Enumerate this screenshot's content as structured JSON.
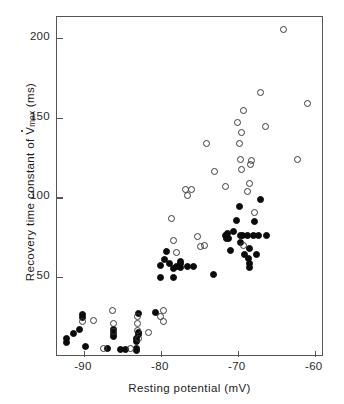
{
  "chart_data": {
    "type": "scatter",
    "title": "",
    "xlabel": "Resting potential (mV)",
    "ylabel_parts": {
      "before": "Recovery time constant of ",
      "symbol": "V",
      "subscript": "max",
      "after": " (ms)"
    },
    "ylabel": "Recovery time constant of V̇max (ms)",
    "xlim": [
      -93.5,
      -58.8
    ],
    "ylim": [
      0,
      213
    ],
    "xticks": [
      -90,
      -80,
      -70,
      -60
    ],
    "xtick_labels": [
      "-90",
      "-80",
      "-70",
      "-60"
    ],
    "yticks": [
      50,
      100,
      150,
      200
    ],
    "ytick_labels": [
      "50",
      "100",
      "150",
      "200"
    ],
    "grid": false,
    "legend": "none",
    "series": [
      {
        "name": "filled-circles",
        "marker": "filled circle",
        "color": "#0b0b0b",
        "points": [
          [
            -92.3,
            11.5
          ],
          [
            -92.3,
            9.0
          ],
          [
            -91.3,
            15.0
          ],
          [
            -90.6,
            17.5
          ],
          [
            -90.2,
            26.5
          ],
          [
            -90.2,
            24.5
          ],
          [
            -89.8,
            6.5
          ],
          [
            -87.0,
            5.5
          ],
          [
            -86.2,
            17.5
          ],
          [
            -86.2,
            15.0
          ],
          [
            -86.2,
            13.0
          ],
          [
            -85.3,
            5.0
          ],
          [
            -84.6,
            4.5
          ],
          [
            -83.2,
            11.5
          ],
          [
            -83.2,
            9.5
          ],
          [
            -83.2,
            5.5
          ],
          [
            -83.2,
            4.0
          ],
          [
            -82.9,
            27.0
          ],
          [
            -82.9,
            15.5
          ],
          [
            -82.9,
            14.0
          ],
          [
            -80.7,
            28.0
          ],
          [
            -80.0,
            50.0
          ],
          [
            -80.0,
            57.5
          ],
          [
            -79.5,
            61.0
          ],
          [
            -79.3,
            66.0
          ],
          [
            -78.9,
            58.5
          ],
          [
            -78.3,
            55.5
          ],
          [
            -78.3,
            49.5
          ],
          [
            -78.0,
            57.0
          ],
          [
            -77.4,
            58.5
          ],
          [
            -77.4,
            60.0
          ],
          [
            -77.4,
            56.0
          ],
          [
            -76.6,
            57.0
          ],
          [
            -75.8,
            56.5
          ],
          [
            -73.2,
            51.5
          ],
          [
            -71.6,
            76.0
          ],
          [
            -71.5,
            74.5
          ],
          [
            -71.4,
            77.5
          ],
          [
            -71.2,
            74.5
          ],
          [
            -71.0,
            66.5
          ],
          [
            -70.6,
            78.5
          ],
          [
            -70.2,
            85.5
          ],
          [
            -69.8,
            94.0
          ],
          [
            -69.7,
            76.0
          ],
          [
            -69.6,
            72.0
          ],
          [
            -69.4,
            76.0
          ],
          [
            -69.1,
            64.5
          ],
          [
            -68.8,
            76.0
          ],
          [
            -68.6,
            61.5
          ],
          [
            -68.5,
            68.0
          ],
          [
            -68.5,
            58.5
          ],
          [
            -68.5,
            56.0
          ],
          [
            -67.9,
            76.0
          ],
          [
            -67.8,
            85.0
          ],
          [
            -67.6,
            64.5
          ],
          [
            -67.3,
            76.0
          ],
          [
            -67.0,
            98.5
          ],
          [
            -66.3,
            76.0
          ]
        ]
      },
      {
        "name": "open-circles",
        "marker": "open circle",
        "color": "#3a3a3a",
        "points": [
          [
            -90.2,
            22.0
          ],
          [
            -88.8,
            23.0
          ],
          [
            -87.4,
            5.5
          ],
          [
            -86.3,
            29.0
          ],
          [
            -86.2,
            21.0
          ],
          [
            -86.2,
            16.0
          ],
          [
            -84.0,
            5.5
          ],
          [
            -83.0,
            25.5
          ],
          [
            -83.0,
            21.0
          ],
          [
            -83.0,
            16.5
          ],
          [
            -82.9,
            11.5
          ],
          [
            -81.6,
            15.5
          ],
          [
            -80.0,
            25.5
          ],
          [
            -79.7,
            29.0
          ],
          [
            -79.7,
            22.5
          ],
          [
            -78.6,
            86.5
          ],
          [
            -78.4,
            73.0
          ],
          [
            -78.0,
            65.5
          ],
          [
            -76.8,
            105.0
          ],
          [
            -76.6,
            101.0
          ],
          [
            -76.0,
            105.0
          ],
          [
            -75.2,
            75.5
          ],
          [
            -74.8,
            69.5
          ],
          [
            -74.3,
            70.0
          ],
          [
            -74.1,
            133.5
          ],
          [
            -73.0,
            116.5
          ],
          [
            -71.6,
            107.0
          ],
          [
            -70.0,
            147.0
          ],
          [
            -69.8,
            133.5
          ],
          [
            -69.7,
            124.0
          ],
          [
            -69.5,
            140.5
          ],
          [
            -69.5,
            117.5
          ],
          [
            -69.3,
            154.5
          ],
          [
            -69.2,
            70.0
          ],
          [
            -68.7,
            103.5
          ],
          [
            -68.5,
            109.0
          ],
          [
            -68.4,
            120.5
          ],
          [
            -68.2,
            123.0
          ],
          [
            -67.8,
            90.5
          ],
          [
            -67.0,
            165.5
          ],
          [
            -66.4,
            144.5
          ],
          [
            -64.1,
            205.0
          ],
          [
            -62.2,
            124.0
          ],
          [
            -61.0,
            159.0
          ]
        ]
      }
    ],
    "counts": {
      "filled": 58,
      "open": 44
    }
  },
  "axes": {
    "x_title": "Resting potential (mV)",
    "y_title_before": "Recovery time constant of ",
    "y_title_symbol": "V",
    "y_title_sub": "max",
    "y_title_after": " (ms)"
  }
}
